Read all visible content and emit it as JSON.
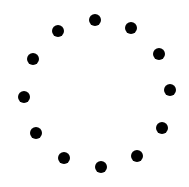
{
  "spinner": {
    "icon": "loading-spinner-icon",
    "dot_color": "#000000",
    "background": "#ffffff",
    "dot_count": 12,
    "dot_diameter": 12,
    "dots": [
      {
        "x": 95,
        "y": 20
      },
      {
        "x": 131,
        "y": 28
      },
      {
        "x": 159,
        "y": 54
      },
      {
        "x": 170,
        "y": 90
      },
      {
        "x": 162,
        "y": 128
      },
      {
        "x": 137,
        "y": 156
      },
      {
        "x": 101,
        "y": 167
      },
      {
        "x": 64,
        "y": 158
      },
      {
        "x": 36,
        "y": 133
      },
      {
        "x": 24,
        "y": 97
      },
      {
        "x": 33,
        "y": 59
      },
      {
        "x": 58,
        "y": 31
      }
    ]
  }
}
